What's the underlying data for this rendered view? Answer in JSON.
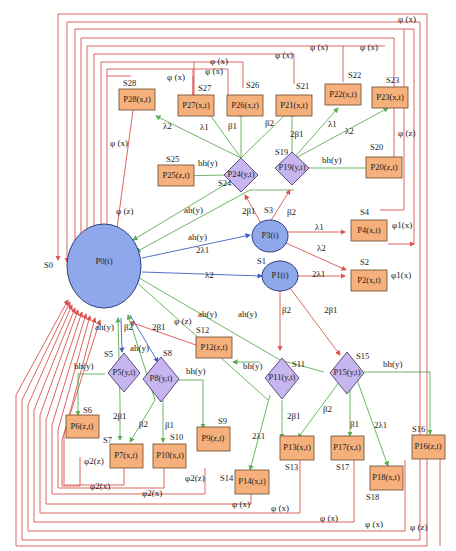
{
  "diagram": {
    "colors": {
      "repair_edges": "#d9534f",
      "partial_failure_edges": "#5cae52",
      "main_edges": "#3f5fc4",
      "rect_fill": "#f5b07c",
      "diamond_fill": "#c6b5ee",
      "circle_fill": "#8fa8ec"
    },
    "nodes": {
      "p0": {
        "label": "P0(t)",
        "state": "S0",
        "shape": "circle"
      },
      "p1": {
        "label": "P1(t)",
        "state": "S1",
        "shape": "circle"
      },
      "p3": {
        "label": "P3(t)",
        "state": "S3",
        "shape": "circle"
      },
      "p2": {
        "label": "P2(x,t)",
        "state": "S2",
        "shape": "rect"
      },
      "p4": {
        "label": "P4(x,t)",
        "state": "S4",
        "shape": "rect"
      },
      "p5": {
        "label": "P5(y,t)",
        "state": "S5",
        "shape": "diamond"
      },
      "p6": {
        "label": "P6(z,t)",
        "state": "S6",
        "shape": "rect"
      },
      "p7": {
        "label": "P7(x,t)",
        "state": "S7",
        "shape": "rect"
      },
      "p8": {
        "label": "P8(y,t)",
        "state": "S8",
        "shape": "diamond"
      },
      "p9": {
        "label": "P9(z,t)",
        "state": "S9",
        "shape": "rect"
      },
      "p10": {
        "label": "P10(x,t)",
        "state": "S10",
        "shape": "rect"
      },
      "p11": {
        "label": "P11(y,t)",
        "state": "S11",
        "shape": "diamond"
      },
      "p12": {
        "label": "P12(z,t)",
        "state": "S12",
        "shape": "rect"
      },
      "p13": {
        "label": "P13(x,t)",
        "state": "S13",
        "shape": "rect"
      },
      "p14": {
        "label": "P14(x,t)",
        "state": "S14",
        "shape": "rect"
      },
      "p15": {
        "label": "P15(y,t)",
        "state": "S15",
        "shape": "diamond"
      },
      "p16": {
        "label": "P16(z,t)",
        "state": "S16",
        "shape": "rect"
      },
      "p17": {
        "label": "P17(x,t)",
        "state": "S17",
        "shape": "rect"
      },
      "p18": {
        "label": "P18(x,t)",
        "state": "S18",
        "shape": "rect"
      },
      "p19": {
        "label": "P19(y,t)",
        "state": "S19",
        "shape": "diamond"
      },
      "p20": {
        "label": "P20(z,t)",
        "state": "S20",
        "shape": "rect"
      },
      "p21": {
        "label": "P21(x,t)",
        "state": "S21",
        "shape": "rect"
      },
      "p22": {
        "label": "P22(x,t)",
        "state": "S22",
        "shape": "rect"
      },
      "p23": {
        "label": "P23(x,t)",
        "state": "S23",
        "shape": "rect"
      },
      "p24": {
        "label": "P24(y,t)",
        "state": "S24",
        "shape": "diamond"
      },
      "p25": {
        "label": "P25(z,t)",
        "state": "S25",
        "shape": "rect"
      },
      "p26": {
        "label": "P26(x,t)",
        "state": "S26",
        "shape": "rect"
      },
      "p27": {
        "label": "P27(x,t)",
        "state": "S27",
        "shape": "rect"
      },
      "p28": {
        "label": "P28(x,t)",
        "state": "S28",
        "shape": "rect"
      }
    },
    "edge_labels": {
      "ah": "ah(y)",
      "bh": "bh(y)",
      "lambda1": "λ1",
      "lambda2": "λ2",
      "two_lambda1": "2λ1",
      "beta1": "β1",
      "beta2": "β2",
      "two_beta1": "2β1",
      "phi_x": "φ (x)",
      "phi_z": "φ (z)",
      "phi1_x": "φ1(x)",
      "phi2_x": "φ2(x)",
      "phi2_z": "φ2(z)"
    }
  }
}
